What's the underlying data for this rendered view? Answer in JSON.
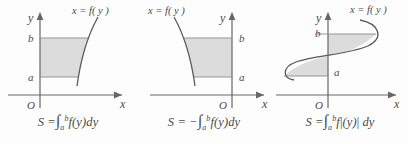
{
  "figure": {
    "colors": {
      "shade_fill": "#dcdcdc",
      "curve_stroke": "#5a5a5a",
      "axis_stroke": "#666666",
      "text": "#4a4a4a",
      "background": "#fdfdfd"
    }
  },
  "panels": [
    {
      "id": "panel-positive",
      "curve_label": "x = f( y )",
      "axis_y_label": "y",
      "axis_x_label": "x",
      "origin_label": "O",
      "tick_upper_label": "b",
      "tick_lower_label": "a",
      "caption": {
        "lhs": "S =",
        "integral": "∫",
        "lower": "a",
        "upper": "b",
        "integrand": "f(y)",
        "differential": "dy",
        "sign": "",
        "abs_open": "",
        "abs_close": ""
      },
      "region_side": "right-of-y-axis",
      "sign_of_f": "positive"
    },
    {
      "id": "panel-negative",
      "curve_label": "x = f( y )",
      "axis_y_label": "y",
      "axis_x_label": "x",
      "origin_label": "O",
      "tick_upper_label": "b",
      "tick_lower_label": "a",
      "caption": {
        "lhs": "S =",
        "integral": "∫",
        "lower": "a",
        "upper": "b",
        "integrand": "f(y)",
        "differential": "dy",
        "sign": "−",
        "abs_open": "",
        "abs_close": ""
      },
      "region_side": "left-of-y-axis",
      "sign_of_f": "negative"
    },
    {
      "id": "panel-absolute",
      "curve_label": "x = f( y )",
      "axis_y_label": "y",
      "axis_x_label": "x",
      "origin_label": "O",
      "tick_upper_label": "b",
      "tick_lower_label": "a",
      "caption": {
        "lhs": "S =",
        "integral": "∫",
        "lower": "a",
        "upper": "b",
        "integrand": "f",
        "differential": "dy",
        "sign": "",
        "abs_open": "|",
        "abs_close": "|",
        "abs_inner": "(y)"
      },
      "region_side": "both-sides",
      "sign_of_f": "mixed"
    }
  ]
}
